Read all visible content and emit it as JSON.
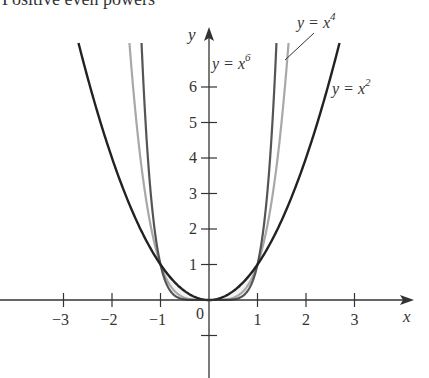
{
  "heading": "Positive even powers",
  "chart_data": {
    "type": "line",
    "title": "Positive even powers",
    "xlabel": "x",
    "ylabel": "y",
    "xlim": [
      -3.3,
      4.2
    ],
    "ylim": [
      -2.2,
      7.6
    ],
    "x_ticks": [
      -3,
      -2,
      -1,
      0,
      1,
      2,
      3
    ],
    "x_tick_labels": [
      "−3",
      "−2",
      "−1",
      "0",
      "1",
      "2",
      "3"
    ],
    "y_ticks": [
      -1,
      1,
      2,
      3,
      4,
      5,
      6
    ],
    "y_tick_labels": [
      "",
      "1",
      "2",
      "3",
      "4",
      "5",
      "6"
    ],
    "grid": false,
    "series": [
      {
        "name": "y = x^2",
        "label_main": "y = x",
        "label_exp": "2",
        "exponent": 2,
        "color": "#222222",
        "width": 2.4
      },
      {
        "name": "y = x^4",
        "label_main": "y = x",
        "label_exp": "4",
        "exponent": 4,
        "color": "#a8a8a8",
        "width": 2.2
      },
      {
        "name": "y = x^6",
        "label_main": "y = x",
        "label_exp": "6",
        "exponent": 6,
        "color": "#555555",
        "width": 2.2
      }
    ],
    "annotations": [
      {
        "text": "y = x^6",
        "near": "x6 curve, left of right branch"
      },
      {
        "text": "y = x^4",
        "near": "top, leader line to x4 curve"
      },
      {
        "text": "y = x^2",
        "near": "right of x2 right branch"
      }
    ],
    "intersections": [
      [
        -1,
        1
      ],
      [
        0,
        0
      ],
      [
        1,
        1
      ]
    ]
  }
}
